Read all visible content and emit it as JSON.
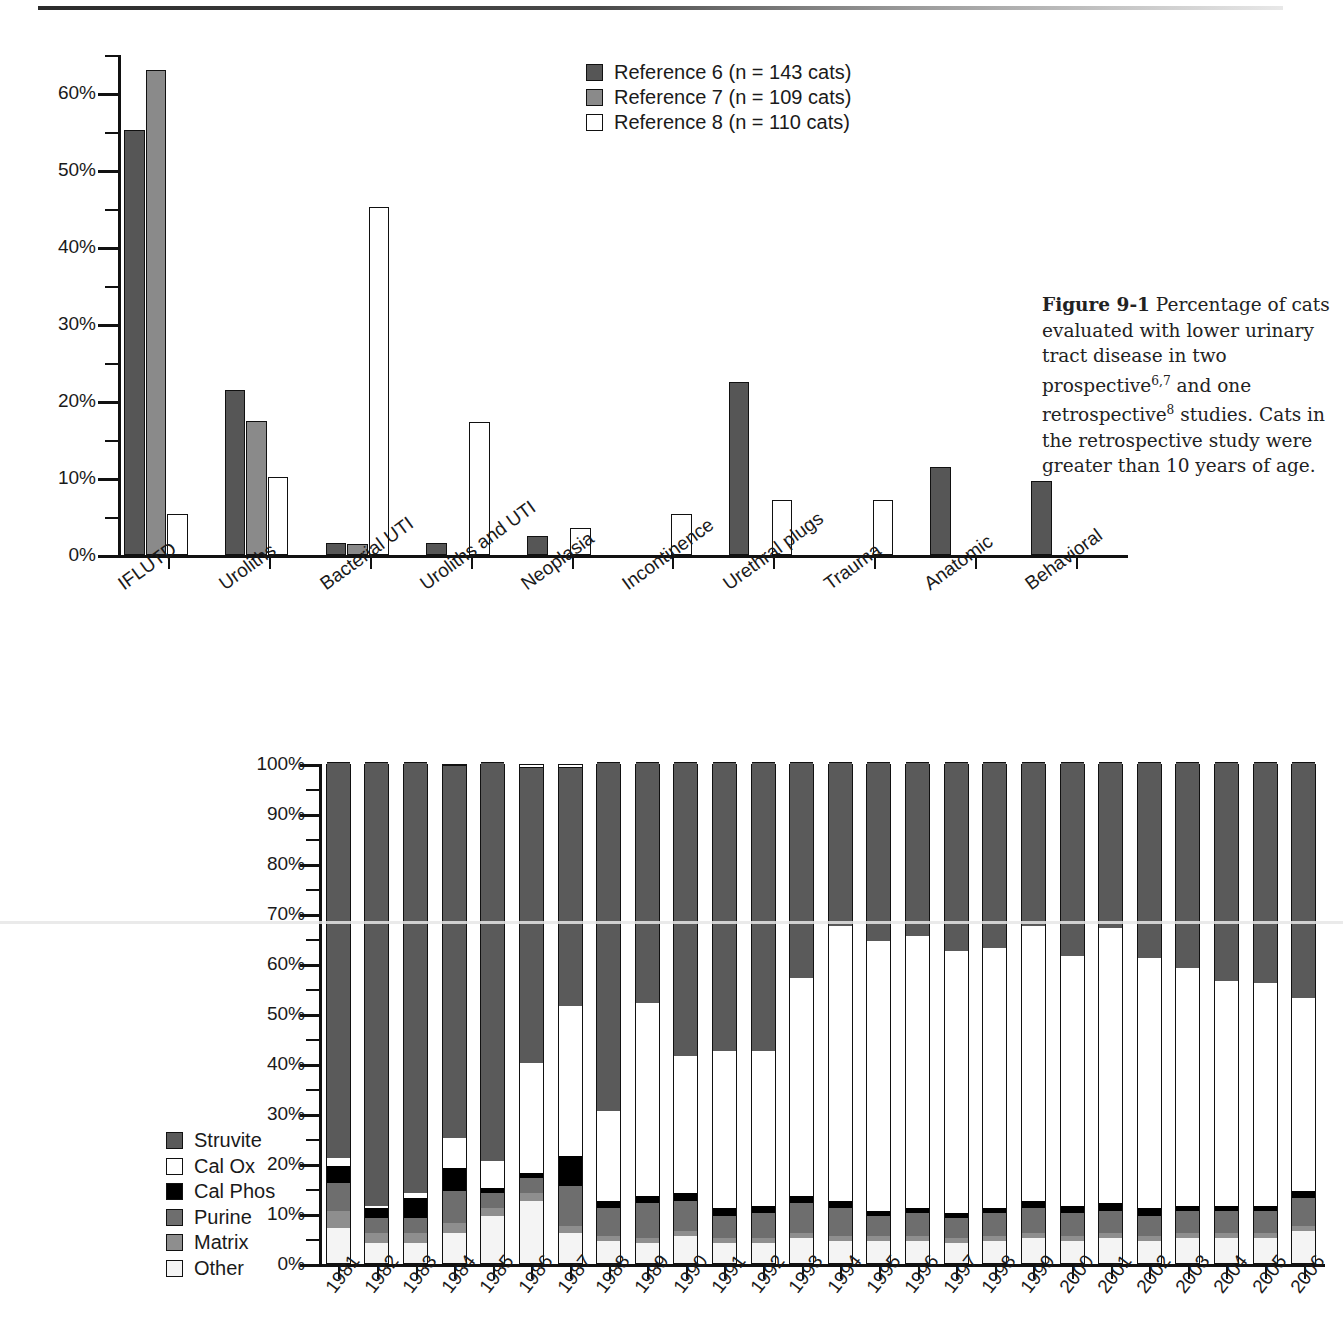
{
  "figure1": {
    "caption_label": "Figure 9-1",
    "caption_text_1": " Percentage of cats evaluated with lower urinary tract disease in two prospective",
    "caption_sup_1": "6,7",
    "caption_text_2": " and one retrospective",
    "caption_sup_2": "8",
    "caption_text_3": " studies. Cats in the retrospective study were greater than 10 years of age.",
    "legend": [
      {
        "label": "Reference 6 (n = 143 cats)",
        "color": "#565656",
        "icon": "legend-swatch-icon"
      },
      {
        "label": "Reference 7 (n = 109 cats)",
        "color": "#8a8a8a",
        "icon": "legend-swatch-icon"
      },
      {
        "label": "Reference 8 (n = 110 cats)",
        "color": "#ffffff",
        "icon": "legend-swatch-icon"
      }
    ],
    "ytick_labels": [
      "0%",
      "10%",
      "20%",
      "30%",
      "40%",
      "50%",
      "60%"
    ]
  },
  "figure2": {
    "legend": [
      {
        "label": "Struvite",
        "color": "#5a5a5a"
      },
      {
        "label": "Cal Ox",
        "color": "#ffffff"
      },
      {
        "label": "Cal Phos",
        "color": "#000000"
      },
      {
        "label": "Purine",
        "color": "#6e6e6e"
      },
      {
        "label": "Matrix",
        "color": "#8e8e8e"
      },
      {
        "label": "Other",
        "color": "#f4f4f4"
      }
    ],
    "ytick_labels": [
      "0%",
      "10%",
      "20%",
      "30%",
      "40%",
      "50%",
      "60%",
      "70%",
      "80%",
      "90%",
      "100%"
    ]
  },
  "chart_data": [
    {
      "type": "bar",
      "title": "Figure 9-1 Percentage of cats evaluated with lower urinary tract disease",
      "xlabel": "",
      "ylabel": "Percentage of cats",
      "ylim": [
        0,
        65
      ],
      "ytick_step": 10,
      "minor_tick_step": 5,
      "grid": false,
      "legend_position": "top-right",
      "categories": [
        "IFLUTD",
        "Uroliths",
        "Bacterial UTI",
        "Uroliths and UTI",
        "Neoplasia",
        "Incontinence",
        "Urethral plugs",
        "Trauma",
        "Anatomic",
        "Behavioral"
      ],
      "series": [
        {
          "name": "Reference 6 (n = 143 cats)",
          "color": "#565656",
          "values": [
            55.2,
            21.5,
            1.5,
            1.6,
            2.5,
            0,
            22.5,
            0,
            11.5,
            9.6
          ]
        },
        {
          "name": "Reference 7 (n = 109 cats)",
          "color": "#8a8a8a",
          "values": [
            63.0,
            17.4,
            1.4,
            0,
            0,
            0,
            0,
            0,
            0,
            0
          ]
        },
        {
          "name": "Reference 8 (n = 110 cats)",
          "color": "#ffffff",
          "values": [
            5.3,
            10.2,
            45.2,
            17.3,
            3.5,
            5.3,
            7.2,
            7.2,
            0,
            0
          ]
        }
      ]
    },
    {
      "type": "bar",
      "subtype": "stacked-100",
      "title": "",
      "xlabel": "",
      "ylabel": "Percentage",
      "ylim": [
        0,
        100
      ],
      "ytick_step": 10,
      "minor_tick_step": 5,
      "grid": false,
      "legend_position": "left",
      "categories": [
        "1981",
        "1982",
        "1983",
        "1984",
        "1985",
        "1986",
        "1987",
        "1988",
        "1989",
        "1990",
        "1991",
        "1992",
        "1993",
        "1994",
        "1995",
        "1996",
        "1997",
        "1998",
        "1999",
        "2000",
        "2001",
        "2002",
        "2003",
        "2004",
        "2005",
        "2006"
      ],
      "stack_order": [
        "Other",
        "Matrix",
        "Purine",
        "Cal Phos",
        "Cal Ox",
        "Struvite"
      ],
      "series": [
        {
          "name": "Other",
          "color": "#f4f4f4",
          "values": [
            7.0,
            4.0,
            4.0,
            6.0,
            9.5,
            12.5,
            6.0,
            4.5,
            4.0,
            5.5,
            4.0,
            4.0,
            5.0,
            4.5,
            4.5,
            4.5,
            4.0,
            4.5,
            5.0,
            4.5,
            5.0,
            4.5,
            5.0,
            5.0,
            5.0,
            6.5
          ]
        },
        {
          "name": "Matrix",
          "color": "#8e8e8e",
          "values": [
            3.5,
            2.0,
            2.0,
            2.0,
            1.5,
            1.5,
            1.5,
            1.0,
            1.0,
            1.0,
            1.0,
            1.0,
            1.0,
            1.0,
            1.0,
            1.0,
            1.0,
            1.0,
            1.0,
            1.0,
            1.0,
            1.0,
            1.0,
            1.0,
            1.0,
            1.0
          ]
        },
        {
          "name": "Purine",
          "color": "#6e6e6e",
          "values": [
            5.5,
            3.0,
            3.0,
            6.5,
            3.0,
            3.0,
            8.0,
            5.5,
            7.0,
            6.0,
            4.5,
            5.0,
            6.0,
            5.5,
            4.0,
            4.5,
            4.0,
            4.5,
            5.0,
            4.5,
            4.5,
            4.0,
            4.5,
            4.5,
            4.5,
            5.5
          ]
        },
        {
          "name": "Cal Phos",
          "color": "#000000",
          "values": [
            3.5,
            2.0,
            4.0,
            4.5,
            1.0,
            1.0,
            6.0,
            1.5,
            1.5,
            1.5,
            1.5,
            1.5,
            1.5,
            1.5,
            1.0,
            1.0,
            1.0,
            1.0,
            1.5,
            1.5,
            1.5,
            1.5,
            1.0,
            1.0,
            1.0,
            1.5
          ]
        },
        {
          "name": "Cal Ox",
          "color": "#ffffff",
          "values": [
            1.5,
            0.5,
            1.0,
            6.0,
            5.5,
            22.0,
            30.0,
            18.0,
            38.5,
            27.5,
            31.5,
            31.0,
            43.5,
            55.0,
            54.0,
            54.5,
            52.5,
            52.0,
            55.0,
            50.0,
            55.0,
            50.0,
            47.5,
            45.0,
            44.5,
            38.5
          ]
        },
        {
          "name": "Struvite",
          "color": "#5a5a5a",
          "values": [
            79.0,
            88.5,
            86.0,
            74.5,
            79.5,
            59.0,
            47.5,
            69.5,
            48.0,
            58.5,
            57.5,
            57.5,
            43.0,
            32.5,
            35.5,
            34.5,
            37.5,
            37.0,
            32.5,
            38.5,
            33.0,
            39.0,
            41.0,
            43.5,
            44.0,
            47.0
          ]
        }
      ]
    }
  ]
}
